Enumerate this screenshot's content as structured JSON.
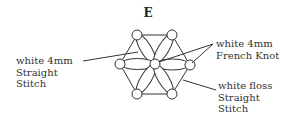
{
  "title": "E",
  "labels": {
    "left": {
      "line1": "white  4mm",
      "line2": "Straight",
      "line3": "Stitch"
    },
    "knot": {
      "line1": "white  4mm",
      "line2": "French Knot"
    },
    "floss": {
      "line1": "white floss",
      "line2": "Straight",
      "line3": "Stitch"
    }
  }
}
